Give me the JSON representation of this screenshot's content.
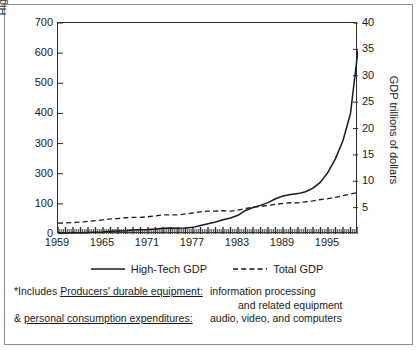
{
  "chart_data": {
    "type": "line",
    "title": "",
    "xlabel": "",
    "ylabel": "High tech billions of dollars",
    "y2label": "GDP trillions of dollars",
    "grid": false,
    "legend_position": "bottom-center",
    "xlim": [
      1959,
      1999
    ],
    "ylim": [
      0,
      700
    ],
    "y2lim": [
      0,
      40
    ],
    "xticks_labeled": [
      "1959",
      "1965",
      "1971",
      "1977",
      "1983",
      "1989",
      "1995"
    ],
    "xtick_values": [
      1959,
      1965,
      1971,
      1977,
      1983,
      1989,
      1995
    ],
    "xtick_minor_step": 1,
    "yticks_left": [
      "0",
      "100",
      "300",
      "300",
      "400",
      "500",
      "600",
      "700"
    ],
    "ytick_left_values": [
      0,
      100,
      200,
      300,
      400,
      500,
      600,
      700
    ],
    "yticks_right": [
      "5",
      "10",
      "15",
      "20",
      "25",
      "30",
      "35",
      "40"
    ],
    "ytick_right_values": [
      5,
      10,
      15,
      20,
      25,
      30,
      35,
      40
    ],
    "series": [
      {
        "name": "High-Tech GDP",
        "axis": "left",
        "style": "solid",
        "color": "#1a1a1a",
        "units": "billions of dollars",
        "x": [
          1959,
          1960,
          1961,
          1962,
          1963,
          1964,
          1965,
          1966,
          1967,
          1968,
          1969,
          1970,
          1971,
          1972,
          1973,
          1974,
          1975,
          1976,
          1977,
          1978,
          1979,
          1980,
          1981,
          1982,
          1983,
          1984,
          1985,
          1986,
          1987,
          1988,
          1989,
          1990,
          1991,
          1992,
          1993,
          1994,
          1995,
          1996,
          1997,
          1998,
          1999
        ],
        "values": [
          3,
          3,
          4,
          4,
          5,
          6,
          7,
          9,
          10,
          11,
          13,
          14,
          15,
          17,
          19,
          20,
          19,
          20,
          22,
          28,
          34,
          40,
          47,
          53,
          62,
          78,
          88,
          95,
          104,
          117,
          126,
          131,
          134,
          140,
          152,
          172,
          205,
          250,
          310,
          400,
          610
        ]
      },
      {
        "name": "Total GDP",
        "axis": "right",
        "style": "dashed",
        "color": "#1a1a1a",
        "units": "trillions of dollars",
        "x": [
          1959,
          1960,
          1961,
          1962,
          1963,
          1964,
          1965,
          1966,
          1967,
          1968,
          1969,
          1970,
          1971,
          1972,
          1973,
          1974,
          1975,
          1976,
          1977,
          1978,
          1979,
          1980,
          1981,
          1982,
          1983,
          1984,
          1985,
          1986,
          1987,
          1988,
          1989,
          1990,
          1991,
          1992,
          1993,
          1994,
          1995,
          1996,
          1997,
          1998,
          1999
        ],
        "values": [
          2.05,
          2.1,
          2.16,
          2.29,
          2.39,
          2.53,
          2.69,
          2.86,
          2.94,
          3.08,
          3.17,
          3.17,
          3.27,
          3.44,
          3.64,
          3.62,
          3.61,
          3.8,
          3.98,
          4.2,
          4.34,
          4.32,
          4.43,
          4.34,
          4.54,
          4.86,
          5.06,
          5.23,
          5.4,
          5.62,
          5.81,
          5.92,
          5.91,
          6.11,
          6.28,
          6.54,
          6.7,
          6.96,
          7.26,
          7.57,
          7.9
        ]
      }
    ],
    "annotations": [
      "*Includes Producers' durable equipment: information processing and related equipment",
      "& personal consumption expenditures: audio, video, and computers"
    ]
  },
  "axes": {
    "left_title": "High tech billions of dollars",
    "right_title": "GDP trillions of dollars"
  },
  "legend": {
    "items": [
      {
        "label": "High-Tech GDP",
        "style": "solid"
      },
      {
        "label": "Total GDP",
        "style": "dashed"
      }
    ]
  },
  "footnotes": {
    "line1_left_pre": "*Includes ",
    "line1_left_underline": "Producers' durable equipment:",
    "line1_right": "information processing",
    "line2_right": "and related equipment",
    "line3_left_pre": "& ",
    "line3_left_underline": "personal consumption expenditures:",
    "line3_right": "audio, video, and computers"
  },
  "colors": {
    "ink": "#1a1a1a",
    "frame": "#8a8a8a",
    "axis": "#2b2b2b",
    "background": "#ffffff"
  }
}
